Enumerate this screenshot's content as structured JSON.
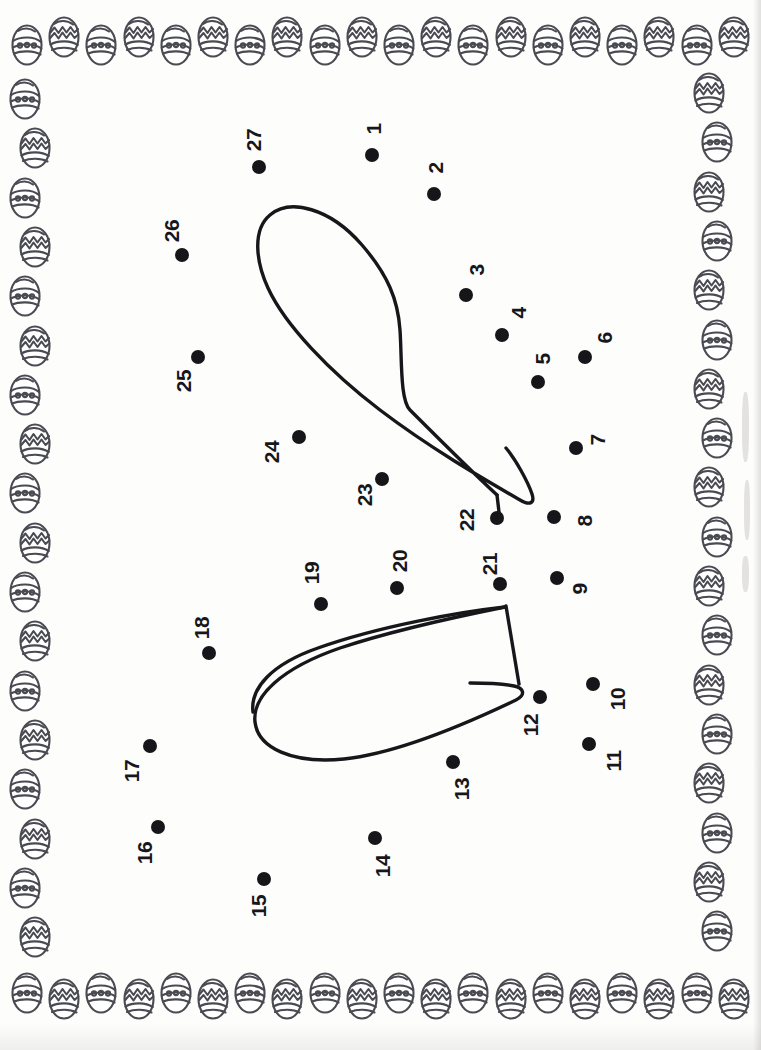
{
  "page": {
    "width": 761,
    "height": 1050,
    "background_color": "#fdfdfc",
    "ink_color": "#16161a",
    "border_ink_color": "#4a4a52"
  },
  "border": {
    "motif": "easter-egg",
    "egg_styles": [
      "banded-dots",
      "zigzag"
    ],
    "egg_width": 34,
    "egg_height": 46,
    "rows": {
      "top_count": 20,
      "bottom_count": 20,
      "left_count": 18,
      "right_count": 18
    }
  },
  "puzzle": {
    "type": "connect-the-dots",
    "subject": "bunny-ears",
    "dot_count": 27,
    "dot_radius": 7,
    "label_rotation_deg": -90,
    "dots": [
      {
        "n": "1",
        "x": 372,
        "y": 155,
        "lx": 374,
        "ly": 129
      },
      {
        "n": "2",
        "x": 434,
        "y": 194,
        "lx": 436,
        "ly": 168
      },
      {
        "n": "3",
        "x": 466,
        "y": 295,
        "lx": 477,
        "ly": 270
      },
      {
        "n": "4",
        "x": 502,
        "y": 335,
        "lx": 519,
        "ly": 313
      },
      {
        "n": "5",
        "x": 538,
        "y": 382,
        "lx": 543,
        "ly": 359
      },
      {
        "n": "6",
        "x": 585,
        "y": 357,
        "lx": 605,
        "ly": 338
      },
      {
        "n": "7",
        "x": 576,
        "y": 448,
        "lx": 598,
        "ly": 440
      },
      {
        "n": "8",
        "x": 554,
        "y": 517,
        "lx": 585,
        "ly": 521
      },
      {
        "n": "9",
        "x": 557,
        "y": 578,
        "lx": 580,
        "ly": 589
      },
      {
        "n": "10",
        "x": 593,
        "y": 684,
        "lx": 618,
        "ly": 699
      },
      {
        "n": "11",
        "x": 589,
        "y": 744,
        "lx": 614,
        "ly": 761
      },
      {
        "n": "12",
        "x": 540,
        "y": 697,
        "lx": 531,
        "ly": 725
      },
      {
        "n": "13",
        "x": 453,
        "y": 762,
        "lx": 462,
        "ly": 789
      },
      {
        "n": "14",
        "x": 375,
        "y": 838,
        "lx": 383,
        "ly": 866
      },
      {
        "n": "15",
        "x": 264,
        "y": 879,
        "lx": 259,
        "ly": 906
      },
      {
        "n": "16",
        "x": 158,
        "y": 827,
        "lx": 145,
        "ly": 853
      },
      {
        "n": "17",
        "x": 150,
        "y": 746,
        "lx": 132,
        "ly": 771
      },
      {
        "n": "18",
        "x": 209,
        "y": 653,
        "lx": 202,
        "ly": 628
      },
      {
        "n": "19",
        "x": 321,
        "y": 604,
        "lx": 312,
        "ly": 573
      },
      {
        "n": "20",
        "x": 397,
        "y": 588,
        "lx": 400,
        "ly": 561
      },
      {
        "n": "21",
        "x": 500,
        "y": 584,
        "lx": 490,
        "ly": 564
      },
      {
        "n": "22",
        "x": 497,
        "y": 518,
        "lx": 467,
        "ly": 520
      },
      {
        "n": "23",
        "x": 382,
        "y": 479,
        "lx": 365,
        "ly": 495
      },
      {
        "n": "24",
        "x": 299,
        "y": 437,
        "lx": 272,
        "ly": 452
      },
      {
        "n": "25",
        "x": 198,
        "y": 357,
        "lx": 184,
        "ly": 381
      },
      {
        "n": "26",
        "x": 182,
        "y": 255,
        "lx": 172,
        "ly": 231
      },
      {
        "n": "27",
        "x": 259,
        "y": 167,
        "lx": 254,
        "ly": 140
      }
    ],
    "outline_stroke_width": 3.4,
    "outline_color": "#17171b"
  }
}
